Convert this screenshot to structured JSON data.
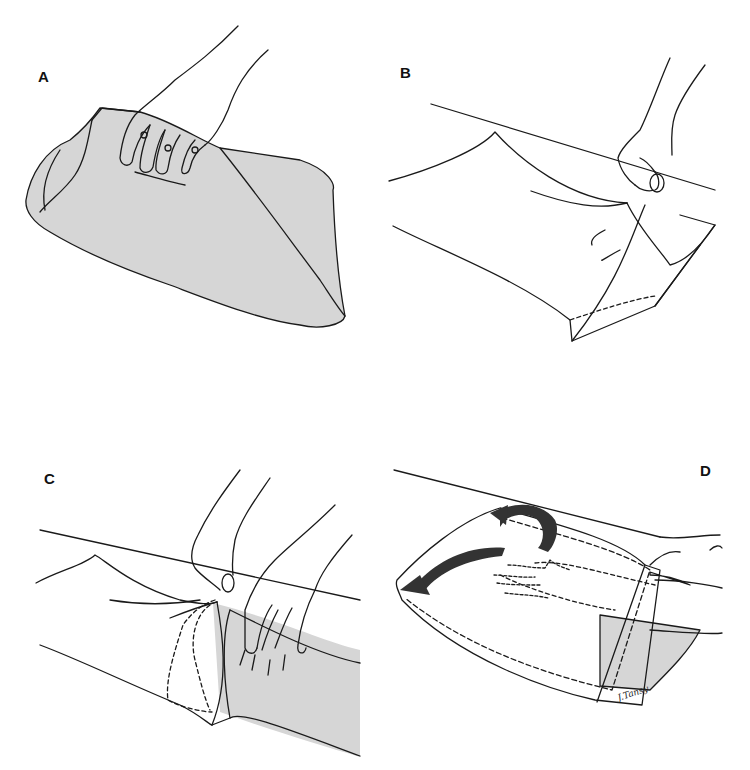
{
  "figure": {
    "panels": [
      {
        "id": "A",
        "label": "A",
        "description": "Hand gathering fabric of a pillowcase laid on a surface"
      },
      {
        "id": "B",
        "label": "B",
        "description": "Hand lifting open end of pillowcase"
      },
      {
        "id": "C",
        "label": "C",
        "description": "Two hands: one holding open end, other gathering fabric"
      },
      {
        "id": "D",
        "label": "D",
        "description": "Pillowcase pulled over, arrows indicating folding motion, dashed hand outline inside"
      }
    ],
    "signature": "J.Tansy",
    "colors": {
      "fill_gray": "#d6d6d6",
      "line": "#1a1a1a",
      "arrow": "#333333",
      "background": "#ffffff"
    }
  }
}
